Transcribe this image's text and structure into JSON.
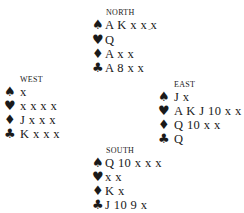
{
  "diagram": {
    "north": {
      "label": "NORTH",
      "spades": "A K x x x",
      "hearts": "Q",
      "diamonds": "A x x",
      "clubs": "A 8 x x"
    },
    "west": {
      "label": "WEST",
      "spades": "x",
      "hearts": "x x x x",
      "diamonds": "J x x x",
      "clubs": "K x x x"
    },
    "east": {
      "label": "EAST",
      "spades": "J x",
      "hearts": "A K J 10 x x",
      "diamonds": "Q 10 x x",
      "clubs": "Q"
    },
    "south": {
      "label": "SOUTH",
      "spades": "Q 10 x x x",
      "hearts": "x x",
      "diamonds": "K x",
      "clubs": "J 10 9 x"
    }
  },
  "suits": {
    "spades": "♠",
    "hearts": "♥",
    "diamonds": "♦",
    "clubs": "♣"
  },
  "stray_mark": "-"
}
